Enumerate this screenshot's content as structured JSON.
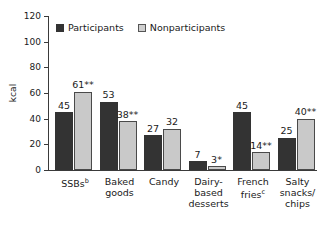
{
  "chart_data": {
    "type": "bar",
    "title": "",
    "xlabel": "",
    "ylabel": "kcal",
    "ylim": [
      0,
      120
    ],
    "yticks": [
      0,
      20,
      40,
      60,
      80,
      100,
      120
    ],
    "grid": false,
    "legend_position": "top-left",
    "categories": [
      "SSBs",
      "Baked goods",
      "Candy",
      "Dairy-based desserts",
      "French fries",
      "Salty snacks/chips"
    ],
    "category_superscripts": [
      "b",
      "",
      "",
      "",
      "c",
      ""
    ],
    "category_lines": [
      [
        "SSBs"
      ],
      [
        "Baked",
        "goods"
      ],
      [
        "Candy"
      ],
      [
        "Dairy-",
        "based",
        "desserts"
      ],
      [
        "French",
        "fries"
      ],
      [
        "Salty",
        "snacks/",
        "chips"
      ]
    ],
    "series": [
      {
        "name": "Participants",
        "color": "#333333",
        "values": [
          45,
          53,
          27,
          7,
          45,
          25
        ],
        "labels": [
          "45",
          "53",
          "27",
          "7",
          "45",
          "25"
        ]
      },
      {
        "name": "Nonparticipants",
        "color": "#c9c9c9",
        "values": [
          61,
          38,
          32,
          3,
          14,
          40
        ],
        "labels": [
          "61**",
          "38**",
          "32",
          "3*",
          "14**",
          "40**"
        ]
      }
    ]
  },
  "legend": {
    "items": [
      {
        "label": "Participants",
        "swatch": "dark-square-icon"
      },
      {
        "label": "Nonparticipants",
        "swatch": "light-square-icon"
      }
    ]
  },
  "axis": {
    "y_label": "kcal",
    "y_tick_labels": [
      "120",
      "100",
      "80",
      "60",
      "40",
      "20",
      "0"
    ]
  }
}
